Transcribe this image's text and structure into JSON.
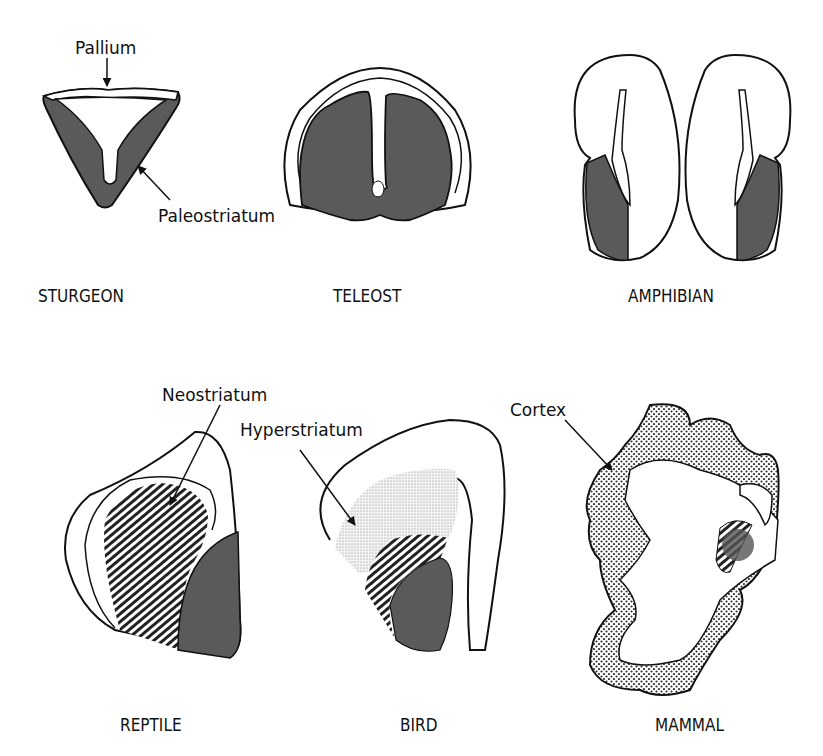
{
  "figure": {
    "panels": [
      {
        "species": "STURGEON",
        "annotations": [
          "Pallium",
          "Paleostriatum"
        ]
      },
      {
        "species": "TELEOST",
        "annotations": []
      },
      {
        "species": "AMPHIBIAN",
        "annotations": []
      },
      {
        "species": "REPTILE",
        "annotations": [
          "Neostriatum"
        ]
      },
      {
        "species": "BIRD",
        "annotations": [
          "Hyperstriatum"
        ]
      },
      {
        "species": "MAMMAL",
        "annotations": [
          "Cortex"
        ]
      }
    ],
    "labels": {
      "pallium": "Pallium",
      "paleostriatum": "Paleostriatum",
      "neostriatum": "Neostriatum",
      "hyperstriatum": "Hyperstriatum",
      "cortex": "Cortex",
      "sturgeon": "STURGEON",
      "teleost": "TELEOST",
      "amphibian": "AMPHIBIAN",
      "reptile": "REPTILE",
      "bird": "BIRD",
      "mammal": "MAMMAL"
    },
    "legend_fills": {
      "paleostriatum": "dark gray solid",
      "neostriatum": "diagonal hatching",
      "hyperstriatum": "fine stipple",
      "cortex": "coarse dot pattern"
    },
    "colors": {
      "ink": "#111111",
      "dark_fill": "#5a5a5a",
      "background": "#ffffff"
    }
  }
}
